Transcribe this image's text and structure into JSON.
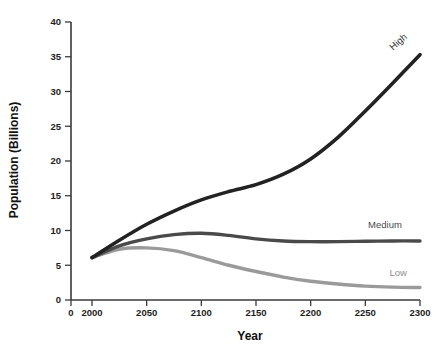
{
  "chart_data": {
    "type": "line",
    "title": "",
    "xlabel": "Year",
    "ylabel": "Population (Billions)",
    "xlim": [
      2000,
      2300
    ],
    "ylim": [
      0,
      40
    ],
    "grid": false,
    "legend_position": "inline-end-of-line",
    "x_origin_label": "0",
    "xticks": [
      2000,
      2050,
      2100,
      2150,
      2200,
      2250,
      2300
    ],
    "xtick_labels": [
      "2000",
      "2050",
      "2100",
      "2150",
      "2200",
      "2250",
      "2300"
    ],
    "yticks": [
      0,
      5,
      10,
      15,
      20,
      25,
      30,
      35,
      40
    ],
    "ytick_labels": [
      "0",
      "5",
      "10",
      "15",
      "20",
      "25",
      "30",
      "35",
      "40"
    ],
    "x": [
      2000,
      2025,
      2050,
      2075,
      2100,
      2125,
      2150,
      2175,
      2200,
      2225,
      2250,
      2275,
      2300
    ],
    "series": [
      {
        "name": "High",
        "color": "#222222",
        "width": 3.6,
        "label": "High",
        "label_rotation": -42,
        "values": [
          6.1,
          8.6,
          10.9,
          12.8,
          14.4,
          15.6,
          16.6,
          18.1,
          20.3,
          23.4,
          27.2,
          31.2,
          35.3
        ]
      },
      {
        "name": "Medium",
        "color": "#4a4a4a",
        "width": 3.4,
        "label": "Medium",
        "label_rotation": 0,
        "values": [
          6.1,
          7.8,
          8.8,
          9.4,
          9.6,
          9.3,
          8.8,
          8.5,
          8.4,
          8.4,
          8.45,
          8.5,
          8.5
        ]
      },
      {
        "name": "Low",
        "color": "#9a9a9a",
        "width": 3.4,
        "label": "Low",
        "label_rotation": 0,
        "values": [
          6.1,
          7.3,
          7.5,
          7.1,
          6.1,
          5.0,
          4.1,
          3.3,
          2.7,
          2.3,
          2.0,
          1.85,
          1.8
        ]
      }
    ],
    "annotations": [
      {
        "text": "High",
        "x": 2282,
        "y": 36.8
      },
      {
        "text": "Medium",
        "x": 2268,
        "y": 10.3
      },
      {
        "text": "Low",
        "x": 2280,
        "y": 3.5
      }
    ]
  },
  "colors": {
    "background": "#ffffff",
    "axis": "#3a3a3a",
    "high": "#222222",
    "medium": "#4a4a4a",
    "low": "#9a9a9a"
  }
}
